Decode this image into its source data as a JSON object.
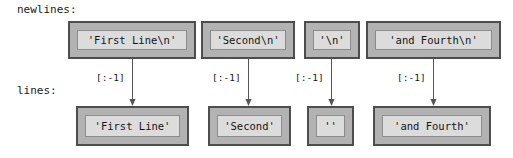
{
  "figure": {
    "background_color": "#ffffff",
    "box_fill_outer": "#b2b2b2",
    "box_fill_inner": "#dcdcdc",
    "box_border_outer": "#4d4d4d",
    "box_border_inner": "#8c8c8c",
    "text_color": "#141414",
    "arrow_color": "#555555"
  },
  "rows": {
    "newlines_label": "newlines:",
    "lines_label": "lines:"
  },
  "newlines": [
    {
      "text": "'First Line\\n'"
    },
    {
      "text": "'Second\\n'"
    },
    {
      "text": "'\\n'"
    },
    {
      "text": "'and Fourth\\n'"
    }
  ],
  "lines": [
    {
      "text": "'First Line'"
    },
    {
      "text": "'Second'"
    },
    {
      "text": "''"
    },
    {
      "text": "'and Fourth'"
    }
  ],
  "edges": [
    {
      "label": "[:-1]"
    },
    {
      "label": "[:-1]"
    },
    {
      "label": "[:-1]"
    },
    {
      "label": "[:-1]"
    }
  ]
}
